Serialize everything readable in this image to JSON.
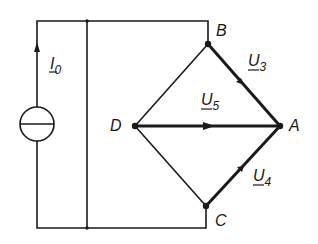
{
  "diagram": {
    "type": "bridge circuit",
    "source": {
      "label": "I",
      "subscript": "0"
    },
    "nodes": {
      "A": "A",
      "B": "B",
      "C": "C",
      "D": "D"
    },
    "voltages": [
      {
        "label": "U",
        "subscript": "3",
        "branch": "B-A"
      },
      {
        "label": "U",
        "subscript": "5",
        "branch": "D-A"
      },
      {
        "label": "U",
        "subscript": "4",
        "branch": "C-A"
      }
    ]
  }
}
